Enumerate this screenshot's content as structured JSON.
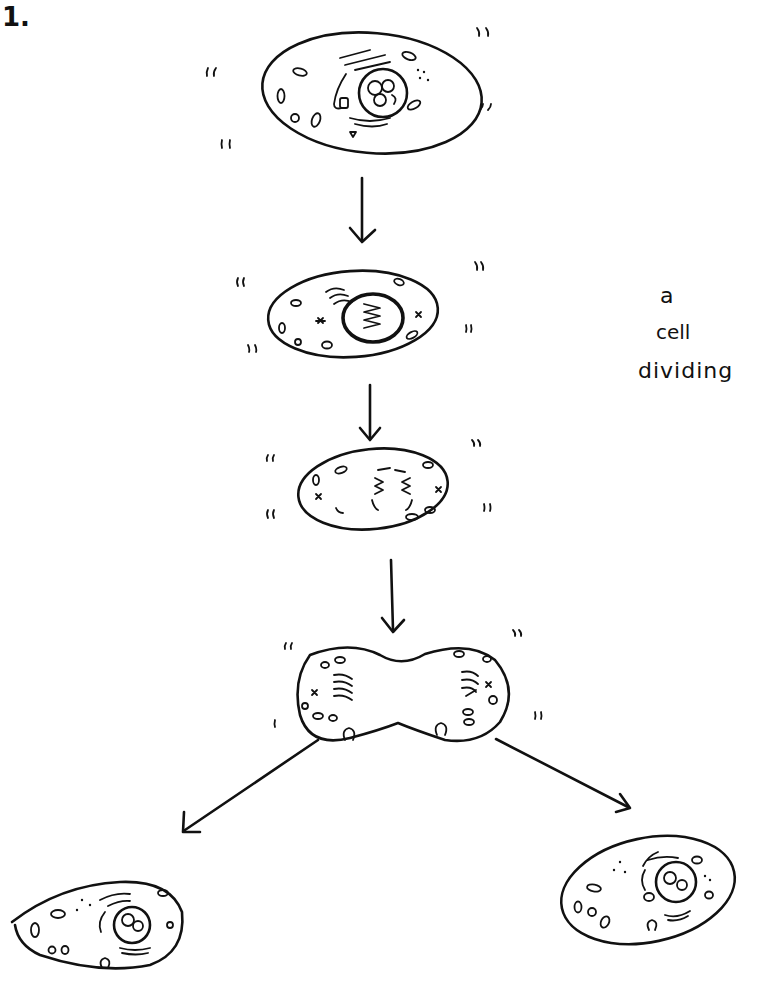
{
  "figure": {
    "number_label": "1.",
    "caption_lines": [
      "a",
      "cell",
      "dividing"
    ],
    "ink_color": "#111111",
    "background": "#ffffff"
  },
  "stages": [
    {
      "id": "interphase",
      "description": "Parent cell with nucleus, organelles"
    },
    {
      "id": "prophase",
      "description": "Cell with condensed chromosomes in nucleus"
    },
    {
      "id": "metaphase",
      "description": "Chromosomes aligned, spindle forming"
    },
    {
      "id": "telophase",
      "description": "Pinching cell with two chromosome groups"
    },
    {
      "id": "daughter-left",
      "description": "Daughter cell (left)"
    },
    {
      "id": "daughter-right",
      "description": "Daughter cell (right)"
    }
  ],
  "arrows": [
    {
      "from": "interphase",
      "to": "prophase"
    },
    {
      "from": "prophase",
      "to": "metaphase"
    },
    {
      "from": "metaphase",
      "to": "telophase"
    },
    {
      "from": "telophase",
      "to": "daughter-left"
    },
    {
      "from": "telophase",
      "to": "daughter-right"
    }
  ]
}
